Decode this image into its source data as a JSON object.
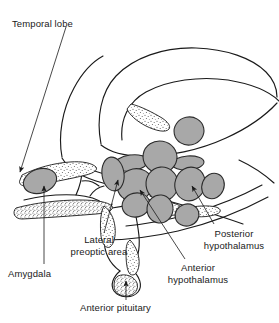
{
  "figure": {
    "kind": "anatomical-diagram",
    "background_color": "#ffffff",
    "outline_color": "#1a1a1a",
    "nucleus_fill_color": "#a8a8a8",
    "nucleus_stroke_color": "#2b2b2b",
    "stipple_color": "#4a4a4a",
    "label_color": "#1a1a1a"
  },
  "labels": {
    "temporal_lobe": "Temporal lobe",
    "amygdala": "Amygdala",
    "lateral_preoptic_area_line1": "Lateral",
    "lateral_preoptic_area_line2": "preoptic area",
    "anterior_pituitary": "Anterior pituitary",
    "anterior_hypothalamus_line1": "Anterior",
    "anterior_hypothalamus_line2": "hypothalamus",
    "posterior_hypothalamus_line1": "Posterior",
    "posterior_hypothalamus_line2": "hypothalamus"
  },
  "structures": [
    {
      "name": "temporal-lobe",
      "label": "Temporal lobe",
      "shaded": false
    },
    {
      "name": "amygdala",
      "label": "Amygdala",
      "shaded": true
    },
    {
      "name": "lateral-preoptic-area",
      "label": "Lateral preoptic area",
      "shaded": true
    },
    {
      "name": "anterior-hypothalamus",
      "label": "Anterior hypothalamus",
      "shaded": true
    },
    {
      "name": "posterior-hypothalamus",
      "label": "Posterior hypothalamus",
      "shaded": true
    },
    {
      "name": "anterior-pituitary",
      "label": "Anterior pituitary",
      "shaded": false
    }
  ]
}
